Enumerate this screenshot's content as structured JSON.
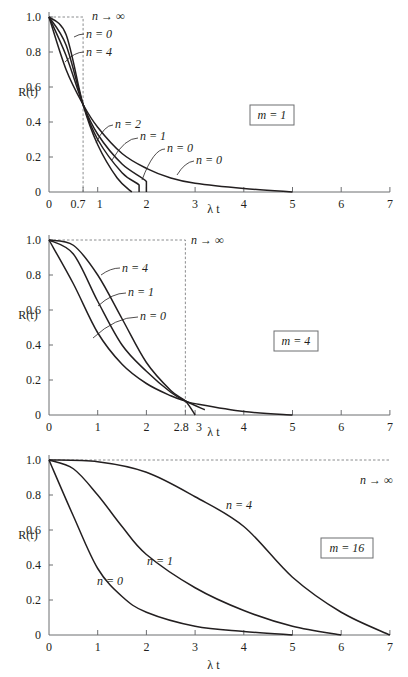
{
  "chart_data": [
    {
      "type": "line",
      "title": "m = 1",
      "box_label": "m = 1",
      "xlabel": "λ t",
      "ylabel": "R(t)",
      "xlim": [
        0,
        7
      ],
      "ylim": [
        0,
        1.0
      ],
      "xticks": [
        "0",
        "0.7",
        "1",
        "2",
        "3",
        "4",
        "5",
        "6",
        "7"
      ],
      "yticks": [
        "0",
        "0.2",
        "0.4",
        "0.6",
        "0.8",
        "1.0"
      ],
      "grid": false,
      "reference": {
        "label": "n → ∞",
        "x": 0.7,
        "description": "step: R=1 until λt=0.7, then 0"
      },
      "series": [
        {
          "name": "n = 0",
          "x": [
            0,
            0.35,
            0.7,
            1,
            1.5,
            2,
            2.5,
            3,
            4,
            5
          ],
          "values": [
            1.0,
            0.7,
            0.5,
            0.37,
            0.22,
            0.135,
            0.08,
            0.05,
            0.02,
            0.0
          ]
        },
        {
          "name": "n = 1",
          "x": [
            0,
            0.35,
            0.7,
            1,
            1.5,
            2,
            2
          ],
          "values": [
            1.0,
            0.78,
            0.5,
            0.33,
            0.16,
            0.06,
            0.0
          ]
        },
        {
          "name": "n = 2",
          "x": [
            0,
            0.35,
            0.7,
            1,
            1.5,
            1.85,
            1.85
          ],
          "values": [
            1.0,
            0.84,
            0.5,
            0.3,
            0.11,
            0.04,
            0.0
          ]
        },
        {
          "name": "n = 4",
          "x": [
            0,
            0.35,
            0.7,
            1,
            1.4,
            1.7
          ],
          "values": [
            1.0,
            0.9,
            0.5,
            0.27,
            0.08,
            0.0
          ]
        }
      ],
      "annotations": [
        "n → ∞",
        "n = 4",
        "n = 0",
        "n = 4",
        "n = 2",
        "n = 1",
        "n = 0"
      ]
    },
    {
      "type": "line",
      "title": "m = 4",
      "box_label": "m = 4",
      "xlabel": "λ t",
      "ylabel": "R(t)",
      "xlim": [
        0,
        7
      ],
      "ylim": [
        0,
        1.0
      ],
      "xticks": [
        "0",
        "1",
        "2",
        "2.8",
        "3",
        "4",
        "5",
        "6",
        "7"
      ],
      "yticks": [
        "0",
        "0.2",
        "0.4",
        "0.6",
        "0.8",
        "1.0"
      ],
      "grid": false,
      "reference": {
        "label": "n → ∞",
        "x": 2.8,
        "description": "step: R=1 until λt=2.8, then 0"
      },
      "series": [
        {
          "name": "n = 0",
          "x": [
            0,
            0.5,
            1,
            1.5,
            2,
            2.5,
            2.8,
            3,
            4,
            5
          ],
          "values": [
            1.0,
            0.75,
            0.47,
            0.29,
            0.18,
            0.11,
            0.08,
            0.065,
            0.02,
            0.0
          ]
        },
        {
          "name": "n = 1",
          "x": [
            0,
            0.5,
            1,
            1.5,
            2,
            2.5,
            2.8,
            3.2
          ],
          "values": [
            1.0,
            0.92,
            0.65,
            0.4,
            0.25,
            0.13,
            0.08,
            0.03
          ]
        },
        {
          "name": "n = 4",
          "x": [
            0,
            0.5,
            1,
            1.5,
            2,
            2.5,
            2.8,
            3.0
          ],
          "values": [
            1.0,
            0.97,
            0.8,
            0.55,
            0.3,
            0.14,
            0.08,
            0.0
          ]
        }
      ],
      "annotations": [
        "n → ∞",
        "n = 4",
        "n = 1",
        "n = 0"
      ]
    },
    {
      "type": "line",
      "title": "m = 16",
      "box_label": "m = 16",
      "xlabel": "λ t",
      "ylabel": "R(t)",
      "xlim": [
        0,
        7
      ],
      "ylim": [
        0,
        1.0
      ],
      "xticks": [
        "0",
        "1",
        "2",
        "3",
        "4",
        "5",
        "6",
        "7"
      ],
      "yticks": [
        "0",
        "0.2",
        "0.4",
        "0.6",
        "0.8",
        "1.0"
      ],
      "grid": false,
      "reference": {
        "label": "n → ∞",
        "description": "R = 1 for all λt shown"
      },
      "series": [
        {
          "name": "n = 0",
          "x": [
            0,
            0.5,
            1,
            1.5,
            2,
            3,
            4,
            5
          ],
          "values": [
            1.0,
            0.68,
            0.38,
            0.22,
            0.13,
            0.05,
            0.02,
            0.0
          ]
        },
        {
          "name": "n = 1",
          "x": [
            0,
            0.5,
            1,
            1.5,
            2,
            3,
            4,
            5,
            6
          ],
          "values": [
            1.0,
            0.95,
            0.8,
            0.62,
            0.46,
            0.27,
            0.14,
            0.05,
            0.0
          ]
        },
        {
          "name": "n = 4",
          "x": [
            0,
            1,
            2,
            3,
            4,
            5,
            6,
            7
          ],
          "values": [
            1.0,
            0.99,
            0.93,
            0.79,
            0.62,
            0.33,
            0.13,
            0.0
          ]
        }
      ],
      "annotations": [
        "n → ∞",
        "n = 4",
        "n = 1",
        "n = 0"
      ]
    }
  ]
}
